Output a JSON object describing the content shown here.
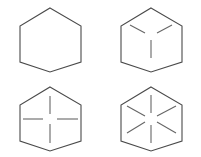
{
  "figure": {
    "type": "abstract-pattern-grid",
    "rows": 2,
    "columns": 2,
    "background_color": "#ffffff",
    "outline_color": "#4a4a4a",
    "ray_color": "#666666",
    "cells": [
      {
        "id": "top-left",
        "position": "row 1, column 1",
        "shape": "hexagon",
        "orientation": "pointy-top",
        "ray_count": 0,
        "ray_pattern": "none",
        "ray_angles_deg": [],
        "description": "Plain hexagon with no internal lines"
      },
      {
        "id": "top-right",
        "position": "row 1, column 2",
        "shape": "hexagon",
        "orientation": "pointy-top",
        "ray_count": 3,
        "ray_pattern": "y-shape",
        "ray_angles_deg": [
          90,
          210,
          330
        ],
        "description": "Hexagon with three radial lines forming a cube-corner Y"
      },
      {
        "id": "bottom-left",
        "position": "row 2, column 1",
        "shape": "hexagon",
        "orientation": "pointy-top",
        "ray_count": 4,
        "ray_pattern": "cross",
        "ray_angles_deg": [
          0,
          90,
          180,
          270
        ],
        "description": "Hexagon with four radial lines forming a plus sign"
      },
      {
        "id": "bottom-right",
        "position": "row 2, column 2",
        "shape": "hexagon",
        "orientation": "pointy-top",
        "ray_count": 6,
        "ray_pattern": "asterisk",
        "ray_angles_deg": [
          30,
          90,
          150,
          210,
          270,
          330
        ],
        "description": "Hexagon with six radial lines forming an asterisk"
      }
    ]
  }
}
